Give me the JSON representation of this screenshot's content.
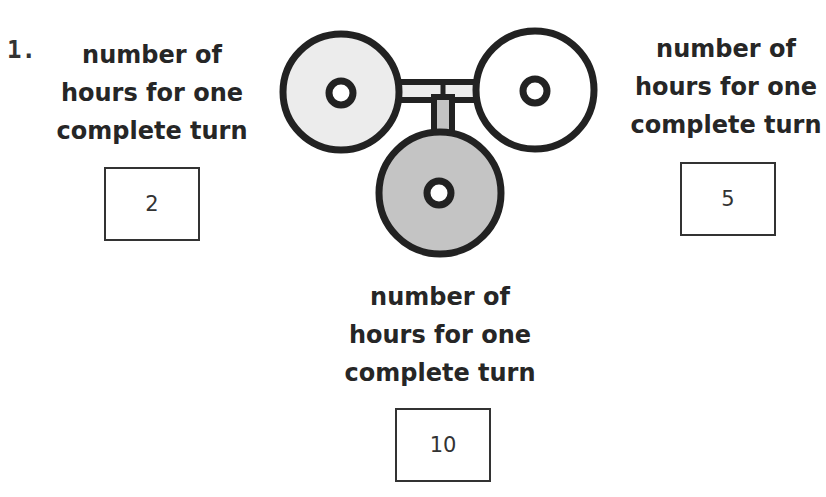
{
  "question": {
    "number": "1.",
    "wheels": [
      {
        "position": "left",
        "label_lines": [
          "number of",
          "hours for one",
          "complete turn"
        ],
        "value": "2",
        "fill": "#ececec"
      },
      {
        "position": "right",
        "label_lines": [
          "number of",
          "hours for one",
          "complete turn"
        ],
        "value": "5",
        "fill": "#ffffff"
      },
      {
        "position": "bottom",
        "label_lines": [
          "number of",
          "hours for one",
          "complete turn"
        ],
        "value": "10",
        "fill": "#c4c4c4"
      }
    ]
  }
}
